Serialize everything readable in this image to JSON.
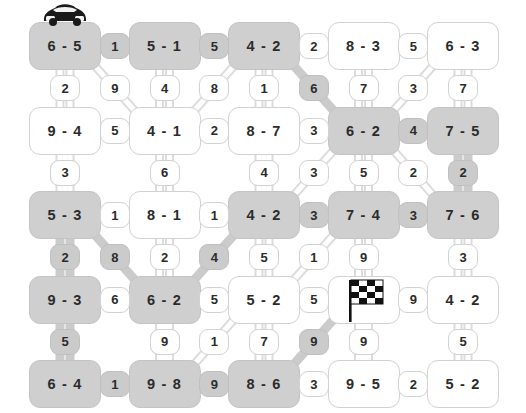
{
  "puzzle": {
    "title": "domino-path-grid",
    "rows": 5,
    "cols": 5,
    "colors": {
      "node_fill": "#ffffff",
      "node_fill_highlight": "#cfcfcf",
      "node_stroke": "#d2d2d2",
      "wire_stroke": "#dcdcdc",
      "wire_highlight": "#cbcbcb",
      "text": "#2b2b2b"
    },
    "markers": {
      "start_icon": "car-icon",
      "start_node": "n0-0",
      "finish_icon": "checkered-flag-icon",
      "finish_node": "n3-3"
    },
    "nodes": [
      [
        {
          "id": "n0-0",
          "label": "6 - 5",
          "highlight": true
        },
        {
          "id": "n0-1",
          "label": "5 - 1",
          "highlight": true
        },
        {
          "id": "n0-2",
          "label": "4 - 2",
          "highlight": true
        },
        {
          "id": "n0-3",
          "label": "8 - 3",
          "highlight": false
        },
        {
          "id": "n0-4",
          "label": "6 - 3",
          "highlight": false
        }
      ],
      [
        {
          "id": "n1-0",
          "label": "9 - 4",
          "highlight": false
        },
        {
          "id": "n1-1",
          "label": "4 - 1",
          "highlight": false
        },
        {
          "id": "n1-2",
          "label": "8 - 7",
          "highlight": false
        },
        {
          "id": "n1-3",
          "label": "6 - 2",
          "highlight": true
        },
        {
          "id": "n1-4",
          "label": "7 - 5",
          "highlight": true
        }
      ],
      [
        {
          "id": "n2-0",
          "label": "5 - 3",
          "highlight": true
        },
        {
          "id": "n2-1",
          "label": "8 - 1",
          "highlight": false
        },
        {
          "id": "n2-2",
          "label": "4 - 2",
          "highlight": true
        },
        {
          "id": "n2-3",
          "label": "7 - 4",
          "highlight": true
        },
        {
          "id": "n2-4",
          "label": "7 - 6",
          "highlight": true
        }
      ],
      [
        {
          "id": "n3-0",
          "label": "9 - 3",
          "highlight": true
        },
        {
          "id": "n3-1",
          "label": "6 - 2",
          "highlight": true
        },
        {
          "id": "n3-2",
          "label": "5 - 2",
          "highlight": false
        },
        {
          "id": "n3-3",
          "label": "",
          "highlight": false
        },
        {
          "id": "n3-4",
          "label": "4 - 2",
          "highlight": false
        }
      ],
      [
        {
          "id": "n4-0",
          "label": "6 - 4",
          "highlight": true
        },
        {
          "id": "n4-1",
          "label": "9 - 8",
          "highlight": true
        },
        {
          "id": "n4-2",
          "label": "8 - 6",
          "highlight": true
        },
        {
          "id": "n4-3",
          "label": "9 - 5",
          "highlight": false
        },
        {
          "id": "n4-4",
          "label": "5 - 2",
          "highlight": false
        }
      ]
    ],
    "horizontal_edges": [
      [
        {
          "id": "h0-0",
          "label": "1",
          "highlight": true
        },
        {
          "id": "h0-1",
          "label": "5",
          "highlight": true
        },
        {
          "id": "h0-2",
          "label": "2",
          "highlight": false
        },
        {
          "id": "h0-3",
          "label": "5",
          "highlight": false
        }
      ],
      [
        {
          "id": "h1-0",
          "label": "5",
          "highlight": false
        },
        {
          "id": "h1-1",
          "label": "2",
          "highlight": false
        },
        {
          "id": "h1-2",
          "label": "3",
          "highlight": false
        },
        {
          "id": "h1-3",
          "label": "4",
          "highlight": true
        }
      ],
      [
        {
          "id": "h2-0",
          "label": "1",
          "highlight": false
        },
        {
          "id": "h2-1",
          "label": "1",
          "highlight": false
        },
        {
          "id": "h2-2",
          "label": "3",
          "highlight": true
        },
        {
          "id": "h2-3",
          "label": "3",
          "highlight": true
        }
      ],
      [
        {
          "id": "h3-0",
          "label": "6",
          "highlight": false
        },
        {
          "id": "h3-1",
          "label": "5",
          "highlight": false
        },
        {
          "id": "h3-2",
          "label": "5",
          "highlight": false
        },
        {
          "id": "h3-3",
          "label": "9",
          "highlight": false
        }
      ],
      [
        {
          "id": "h4-0",
          "label": "1",
          "highlight": true
        },
        {
          "id": "h4-1",
          "label": "9",
          "highlight": true
        },
        {
          "id": "h4-2",
          "label": "3",
          "highlight": false
        },
        {
          "id": "h4-3",
          "label": "2",
          "highlight": false
        }
      ]
    ],
    "vertical_edges": [
      [
        {
          "id": "v0-0",
          "label": "2",
          "highlight": false
        },
        {
          "id": "v0-1",
          "label": "4",
          "highlight": false
        },
        {
          "id": "v0-2",
          "label": "1",
          "highlight": false
        },
        {
          "id": "v0-3",
          "label": "7",
          "highlight": false
        },
        {
          "id": "v0-4",
          "label": "7",
          "highlight": false
        }
      ],
      [
        {
          "id": "v1-0",
          "label": "4",
          "highlight": false
        },
        {
          "id": "v1-1",
          "label": "6",
          "highlight": false
        },
        {
          "id": "v1-2",
          "label": "2",
          "highlight": false
        },
        {
          "id": "v1-3",
          "label": "5",
          "highlight": false
        },
        {
          "id": "v1-4",
          "label": "2",
          "highlight": true
        }
      ],
      [
        {
          "id": "v2-0",
          "label": "2",
          "highlight": true
        },
        {
          "id": "v2-1",
          "label": "2",
          "highlight": false
        },
        {
          "id": "v2-2",
          "label": "5",
          "highlight": false
        },
        {
          "id": "v2-3",
          "label": "9",
          "highlight": false
        },
        {
          "id": "v2-4",
          "label": "3",
          "highlight": false
        }
      ],
      [
        {
          "id": "v3-0",
          "label": "5",
          "highlight": true
        },
        {
          "id": "v3-1",
          "label": "7",
          "highlight": false
        },
        {
          "id": "v3-2",
          "label": "7",
          "highlight": false
        },
        {
          "id": "v3-3",
          "label": "9",
          "highlight": false
        },
        {
          "id": "v3-4",
          "label": "5",
          "highlight": false
        }
      ]
    ],
    "diagonal_edges": [
      {
        "id": "d0",
        "label": "9",
        "highlight": false,
        "from": "n0-0",
        "to": "n1-1"
      },
      {
        "id": "d1",
        "label": "8",
        "highlight": false,
        "from": "n0-2",
        "to": "n1-1"
      },
      {
        "id": "d2",
        "label": "6",
        "highlight": true,
        "from": "n0-2",
        "to": "n1-3"
      },
      {
        "id": "d3",
        "label": "3",
        "highlight": false,
        "from": "n0-4",
        "to": "n1-3"
      },
      {
        "id": "d4",
        "label": "3",
        "highlight": false,
        "from": "n1-0",
        "to": "n2-0"
      },
      {
        "id": "d5",
        "label": "4",
        "highlight": false,
        "from": "n1-2",
        "to": "n2-2"
      },
      {
        "id": "d6",
        "label": "3",
        "highlight": false,
        "from": "n1-3",
        "to": "n2-2"
      },
      {
        "id": "d7",
        "label": "2",
        "highlight": false,
        "from": "n1-3",
        "to": "n2-4"
      },
      {
        "id": "d8",
        "label": "8",
        "highlight": true,
        "from": "n2-0",
        "to": "n3-1"
      },
      {
        "id": "d9",
        "label": "4",
        "highlight": true,
        "from": "n2-2",
        "to": "n3-1"
      },
      {
        "id": "d10",
        "label": "1",
        "highlight": false,
        "from": "n2-3",
        "to": "n3-2"
      },
      {
        "id": "d11",
        "label": "9",
        "highlight": false,
        "from": "n3-1",
        "to": "n4-1"
      },
      {
        "id": "d12",
        "label": "1",
        "highlight": false,
        "from": "n3-2",
        "to": "n4-1"
      },
      {
        "id": "d13",
        "label": "9",
        "highlight": true,
        "from": "n3-3",
        "to": "n4-2"
      },
      {
        "id": "d14",
        "label": "9",
        "highlight": false,
        "from": "n3-3",
        "to": "n4-3"
      }
    ]
  }
}
